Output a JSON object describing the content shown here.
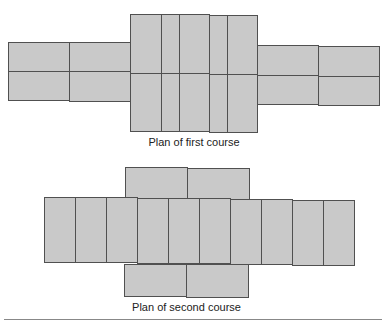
{
  "figure": {
    "first_course": {
      "caption": "Plan of first course",
      "layout": "cross-shaped plan: two-row stretcher arms left and right, central block of header bricks in two rows",
      "left_arm": {
        "rows": 2,
        "bricks_per_row": 2
      },
      "center_block": {
        "rows": 2,
        "bricks_per_row": 6
      },
      "right_arm": {
        "rows": 2,
        "bricks_per_row": 2
      }
    },
    "second_course": {
      "caption": "Plan of second course",
      "layout": "central row of header bricks with stretcher bricks above and below",
      "top_row": {
        "bricks": 2
      },
      "middle_row": {
        "bricks": 10
      },
      "bottom_row": {
        "bricks": 2
      }
    },
    "colors": {
      "brick_fill": "#c9c9c9",
      "brick_stroke": "#505050",
      "caption_text": "#222222",
      "rule": "#888888"
    }
  }
}
